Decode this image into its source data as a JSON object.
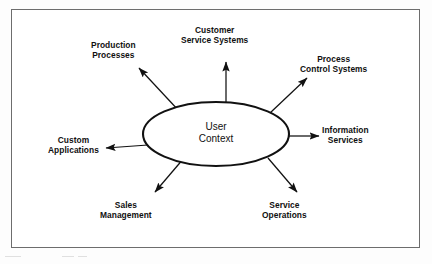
{
  "figure": {
    "kind": "radial-relationship-diagram",
    "border_color": "#6d6d6d",
    "line_color": "#111111",
    "background": "#ffffff"
  },
  "center": {
    "name": "user-context",
    "line1": "User",
    "line2": "Context",
    "shape": "ellipse",
    "cx": 216,
    "cy": 134,
    "rx": 73,
    "ry": 32
  },
  "nodes": [
    {
      "id": "production-processes",
      "line1": "Production",
      "line2": "Processes",
      "angle_deg": 139,
      "label_x": 91,
      "label_y": 40
    },
    {
      "id": "customer-service-systems",
      "line1": "Customer",
      "line2": "Service Systems",
      "angle_deg": 90,
      "label_x": 181,
      "label_y": 25
    },
    {
      "id": "process-control-systems",
      "line1": "Process",
      "line2": "Control Systems",
      "angle_deg": 42,
      "label_x": 300,
      "label_y": 54
    },
    {
      "id": "information-services",
      "line1": "Information",
      "line2": "Services",
      "angle_deg": 0,
      "label_x": 322,
      "label_y": 125
    },
    {
      "id": "service-operations",
      "line1": "Service",
      "line2": "Operations",
      "angle_deg": -44,
      "label_x": 262,
      "label_y": 200
    },
    {
      "id": "sales-management",
      "line1": "Sales",
      "line2": "Management",
      "angle_deg": -134,
      "label_x": 100,
      "label_y": 200
    },
    {
      "id": "custom-applications",
      "line1": "Custom",
      "line2": "Applications",
      "angle_deg": 182,
      "label_x": 48,
      "label_y": 135
    }
  ],
  "connectors": [
    {
      "id": "arrow-production-processes",
      "x1": 180,
      "y1": 112,
      "x2": 139,
      "y2": 68,
      "direction": "outward"
    },
    {
      "id": "arrow-customer-service-systems",
      "x1": 226,
      "y1": 103,
      "x2": 226,
      "y2": 62,
      "direction": "outward"
    },
    {
      "id": "arrow-process-control-systems",
      "x1": 270,
      "y1": 113,
      "x2": 307,
      "y2": 78,
      "direction": "outward"
    },
    {
      "id": "arrow-information-services",
      "x1": 289,
      "y1": 136,
      "x2": 319,
      "y2": 136,
      "direction": "outward"
    },
    {
      "id": "arrow-service-operations",
      "x1": 268,
      "y1": 158,
      "x2": 297,
      "y2": 192,
      "direction": "outward"
    },
    {
      "id": "arrow-sales-management",
      "x1": 184,
      "y1": 158,
      "x2": 155,
      "y2": 192,
      "direction": "outward"
    },
    {
      "id": "arrow-custom-applications",
      "x1": 148,
      "y1": 145,
      "x2": 106,
      "y2": 148,
      "direction": "outward"
    }
  ]
}
